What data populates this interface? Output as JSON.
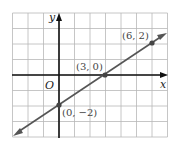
{
  "chart_data": {
    "type": "line",
    "title": "",
    "xlabel": "x",
    "ylabel": "y",
    "origin_label": "O",
    "xlim": [
      -3,
      7
    ],
    "ylim": [
      -4,
      4
    ],
    "grid": true,
    "series": [
      {
        "name": "line",
        "equation": "y = (2/3)x - 2",
        "points": [
          {
            "x": 0,
            "y": -2,
            "label": "(0, −2)"
          },
          {
            "x": 3,
            "y": 0,
            "label": "(3, 0)"
          },
          {
            "x": 6,
            "y": 2,
            "label": "(6, 2)"
          }
        ]
      }
    ]
  },
  "colors": {
    "grid": "#b8b8b8",
    "axis": "#111111",
    "line": "#555555",
    "point": "#444444"
  }
}
